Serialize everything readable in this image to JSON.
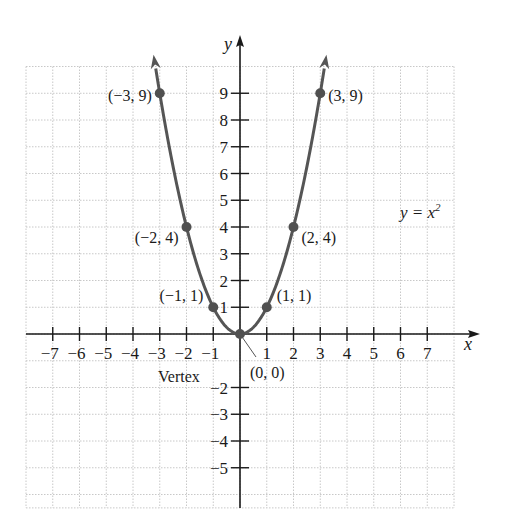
{
  "chart_data": {
    "type": "line",
    "title": "",
    "equation": "y = x^2",
    "xlabel": "x",
    "ylabel": "y",
    "xlim": [
      -8,
      8
    ],
    "ylim": [
      -6.5,
      10
    ],
    "grid": true,
    "x_ticks": [
      -7,
      -6,
      -5,
      -4,
      -3,
      -2,
      -1,
      1,
      2,
      3,
      4,
      5,
      6,
      7
    ],
    "y_ticks": [
      -5,
      -4,
      -3,
      -2,
      1,
      2,
      3,
      4,
      5,
      6,
      7,
      8,
      9
    ],
    "x_tick_labels": [
      "−7",
      "−6",
      "−5",
      "−4",
      "−3",
      "−2",
      "−1",
      "1",
      "2",
      "3",
      "4",
      "5",
      "6",
      "7"
    ],
    "y_tick_labels": [
      "−5",
      "−4",
      "−3",
      "−2",
      "1",
      "2",
      "3",
      "4",
      "5",
      "6",
      "7",
      "8",
      "9"
    ],
    "series": [
      {
        "name": "y = x^2",
        "function": "x^2",
        "domain": [
          -3.15,
          3.15
        ],
        "arrows_at_ends": true,
        "points": [
          {
            "x": -3,
            "y": 9,
            "label": "(−3, 9)"
          },
          {
            "x": -2,
            "y": 4,
            "label": "(−2, 4)"
          },
          {
            "x": -1,
            "y": 1,
            "label": "(−1, 1)"
          },
          {
            "x": 0,
            "y": 0,
            "label": "(0, 0)"
          },
          {
            "x": 1,
            "y": 1,
            "label": "(1, 1)"
          },
          {
            "x": 2,
            "y": 4,
            "label": "(2, 4)"
          },
          {
            "x": 3,
            "y": 9,
            "label": "(3, 9)"
          }
        ]
      }
    ],
    "annotations": [
      {
        "text": "Vertex",
        "points_to": [
          0,
          0
        ]
      },
      {
        "text": "y = x²",
        "position": [
          5.5,
          4.7
        ]
      }
    ]
  },
  "labels": {
    "x_axis": "x",
    "y_axis": "y",
    "equation_main": "y = x",
    "equation_exp": "2",
    "vertex": "Vertex",
    "origin_point": "(0, 0)"
  },
  "colors": {
    "curve": "#555555",
    "point": "#505050",
    "axis": "#1a1a1a",
    "grid": "#c8c8c8"
  }
}
